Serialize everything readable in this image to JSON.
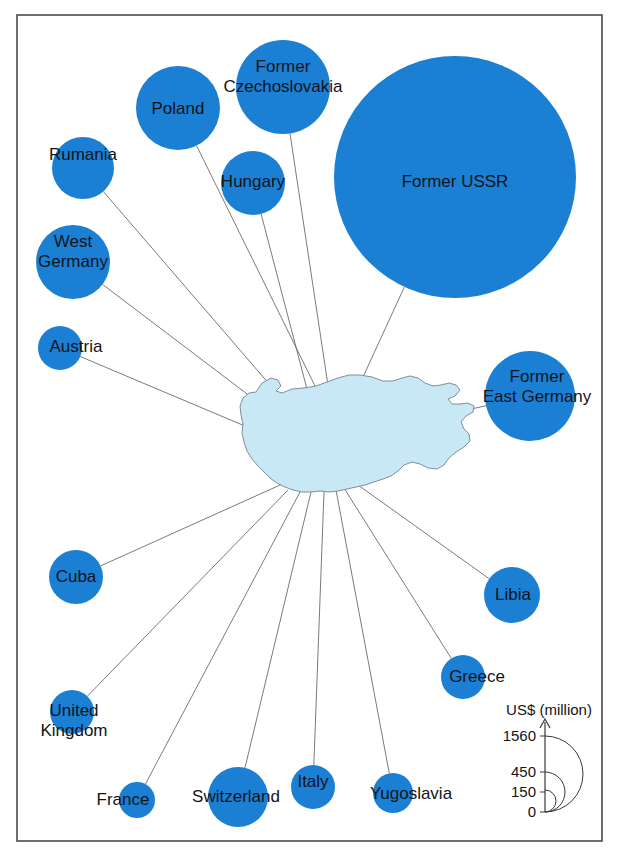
{
  "figure": {
    "frame": {
      "x": 17,
      "y": 15,
      "width": 585,
      "height": 826,
      "stroke": "#4a4a4a"
    },
    "background_color": "#ffffff",
    "bubble_color": "#1b7fd4",
    "map_fill_color": "#c9e8f5",
    "map_stroke_color": "#7d8f99",
    "leader_line_color": "#6b6b6b",
    "label_color": "#111418",
    "map_name": "Bulgaria",
    "map_center": {
      "x": 327,
      "y": 430
    }
  },
  "legend": {
    "unit_label": "US$ (million)",
    "axis_color": "#3a3a3a",
    "ticks": [
      {
        "value": "1560",
        "y": 736
      },
      {
        "value": "450",
        "y": 772
      },
      {
        "value": "150",
        "y": 792
      },
      {
        "value": "0",
        "y": 812
      }
    ],
    "arcs": [
      {
        "value": "1560",
        "radius": 38
      },
      {
        "value": "450",
        "radius": 20
      },
      {
        "value": "150",
        "radius": 11
      }
    ],
    "axis_x": 545,
    "baseline_y": 812,
    "unit_label_pos": {
      "x": 549,
      "y": 711
    }
  },
  "chart_data": {
    "type": "bubble",
    "title": "",
    "subtitle": "",
    "unit": "US$ (million)",
    "center_entity": "Bulgaria",
    "xlabel": "",
    "ylabel": "",
    "legend_values": [
      0,
      150,
      450,
      1560
    ],
    "categories": [
      "Poland",
      "Former Czechoslovakia",
      "Hungary",
      "Former USSR",
      "Rumania",
      "West Germany",
      "Austria",
      "Former East Germany",
      "Cuba",
      "Libia",
      "Greece",
      "United Kingdom",
      "France",
      "Switzerland",
      "Italy",
      "Yugoslavia"
    ],
    "values": [
      200,
      250,
      115,
      1560,
      100,
      155,
      55,
      225,
      80,
      85,
      55,
      55,
      37,
      100,
      55,
      45
    ],
    "bubbles": [
      {
        "label": "Poland",
        "label_lines": [
          "Poland"
        ],
        "cx": 178,
        "cy": 108,
        "r": 42,
        "value": 200,
        "label_x": 178,
        "label_y": 110,
        "font_size": 17,
        "line_to": {
          "x": 318,
          "y": 392
        }
      },
      {
        "label": "Former Czechoslovakia",
        "label_lines": [
          "Former",
          "Czechoslovakia"
        ],
        "cx": 283,
        "cy": 87,
        "r": 47,
        "value": 250,
        "label_x": 283,
        "label_y": 78,
        "font_size": 17,
        "line_to": {
          "x": 329,
          "y": 392
        }
      },
      {
        "label": "Hungary",
        "label_lines": [
          "Hungary"
        ],
        "cx": 253,
        "cy": 183,
        "r": 32,
        "value": 115,
        "label_x": 253,
        "label_y": 183,
        "font_size": 17,
        "line_to": {
          "x": 308,
          "y": 393
        }
      },
      {
        "label": "Former USSR",
        "label_lines": [
          "Former USSR"
        ],
        "cx": 455,
        "cy": 177,
        "r": 121,
        "value": 1560,
        "label_x": 455,
        "label_y": 183,
        "font_size": 17,
        "line_to": {
          "x": 357,
          "y": 390
        }
      },
      {
        "label": "Rumania",
        "label_lines": [
          "Rumania"
        ],
        "cx": 83,
        "cy": 168,
        "r": 31,
        "value": 100,
        "label_x": 83,
        "label_y": 156,
        "font_size": 17,
        "line_to": {
          "x": 295,
          "y": 414
        }
      },
      {
        "label": "West Germany",
        "label_lines": [
          "West",
          "Germany"
        ],
        "cx": 73,
        "cy": 262,
        "r": 37,
        "value": 155,
        "label_x": 73,
        "label_y": 253,
        "font_size": 17,
        "line_to": {
          "x": 288,
          "y": 425
        }
      },
      {
        "label": "Austria",
        "label_lines": [
          "Austria"
        ],
        "cx": 60,
        "cy": 348,
        "r": 22,
        "value": 55,
        "label_x": 76,
        "label_y": 348,
        "font_size": 17,
        "line_to": {
          "x": 278,
          "y": 440
        }
      },
      {
        "label": "Former East Germany",
        "label_lines": [
          "Former",
          "East Germany"
        ],
        "cx": 530,
        "cy": 396,
        "r": 45,
        "value": 225,
        "label_x": 537,
        "label_y": 388,
        "font_size": 17,
        "line_to": {
          "x": 399,
          "y": 425
        }
      },
      {
        "label": "Cuba",
        "label_lines": [
          "Cuba"
        ],
        "cx": 76,
        "cy": 577,
        "r": 27,
        "value": 80,
        "label_x": 76,
        "label_y": 578,
        "font_size": 17,
        "line_to": {
          "x": 289,
          "y": 481
        }
      },
      {
        "label": "Libia",
        "label_lines": [
          "Libia"
        ],
        "cx": 512,
        "cy": 595,
        "r": 28,
        "value": 85,
        "label_x": 513,
        "label_y": 596,
        "font_size": 17,
        "line_to": {
          "x": 358,
          "y": 485
        }
      },
      {
        "label": "Greece",
        "label_lines": [
          "Greece"
        ],
        "cx": 463,
        "cy": 677,
        "r": 22,
        "value": 55,
        "label_x": 477,
        "label_y": 678,
        "font_size": 17,
        "line_to": {
          "x": 344,
          "y": 488
        }
      },
      {
        "label": "United Kingdom",
        "label_lines": [
          "United",
          "Kingdom"
        ],
        "cx": 72,
        "cy": 712,
        "r": 22,
        "value": 55,
        "label_x": 74,
        "label_y": 722,
        "font_size": 17,
        "line_to": {
          "x": 288,
          "y": 490
        }
      },
      {
        "label": "France",
        "label_lines": [
          "France"
        ],
        "cx": 137,
        "cy": 800,
        "r": 18,
        "value": 37,
        "label_x": 123,
        "label_y": 801,
        "font_size": 17,
        "line_to": {
          "x": 300,
          "y": 492
        }
      },
      {
        "label": "Switzerland",
        "label_lines": [
          "Switzerland"
        ],
        "cx": 238,
        "cy": 797,
        "r": 30,
        "value": 100,
        "label_x": 236,
        "label_y": 798,
        "font_size": 17,
        "line_to": {
          "x": 311,
          "y": 492
        }
      },
      {
        "label": "Italy",
        "label_lines": [
          "Italy"
        ],
        "cx": 313,
        "cy": 787,
        "r": 22,
        "value": 55,
        "label_x": 313,
        "label_y": 783,
        "font_size": 17,
        "line_to": {
          "x": 324,
          "y": 492
        }
      },
      {
        "label": "Yugoslavia",
        "label_lines": [
          "Yugoslavia"
        ],
        "cx": 393,
        "cy": 793,
        "r": 20,
        "value": 45,
        "label_x": 411,
        "label_y": 795,
        "font_size": 17,
        "line_to": {
          "x": 336,
          "y": 490
        }
      }
    ]
  }
}
